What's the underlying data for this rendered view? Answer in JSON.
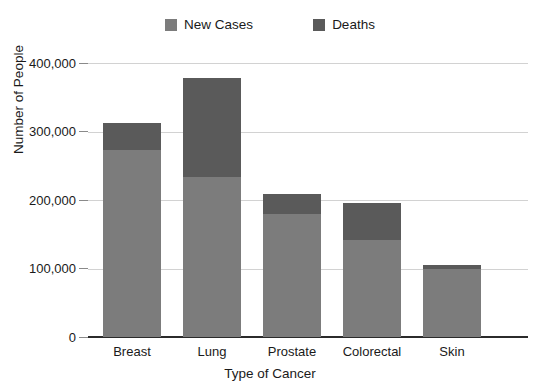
{
  "chart_data": {
    "type": "bar",
    "subtype": "stacked",
    "title": "",
    "xlabel": "Type of Cancer",
    "ylabel": "Number of People",
    "categories": [
      "Breast",
      "Lung",
      "Prostate",
      "Colorectal",
      "Skin"
    ],
    "series": [
      {
        "name": "New Cases",
        "color": "#7c7c7c",
        "values": [
          273000,
          234000,
          180000,
          142000,
          99000
        ]
      },
      {
        "name": "Deaths",
        "color": "#5a5a5a",
        "values": [
          39000,
          144000,
          29000,
          54000,
          6000
        ]
      }
    ],
    "totals": [
      312000,
      378000,
      209000,
      196000,
      105000
    ],
    "ylim": [
      0,
      400000
    ],
    "ytick_values": [
      0,
      100000,
      200000,
      300000,
      400000
    ],
    "ytick_labels": [
      "0",
      "100,000",
      "200,000",
      "300,000",
      "400,000"
    ],
    "grid": true,
    "legend_position": "top-center"
  },
  "legend": {
    "entries": [
      {
        "label": "New Cases",
        "color": "#7c7c7c"
      },
      {
        "label": "Deaths",
        "color": "#5a5a5a"
      }
    ]
  },
  "axes": {
    "y": {
      "title": "Number of People",
      "ticks": [
        "0",
        "100,000",
        "200,000",
        "300,000",
        "400,000"
      ]
    },
    "x": {
      "title": "Type of Cancer",
      "ticks": [
        "Breast",
        "Lung",
        "Prostate",
        "Colorectal",
        "Skin"
      ]
    }
  },
  "colors": {
    "new_cases": "#7c7c7c",
    "deaths": "#5a5a5a",
    "gridline": "#d2d2d2",
    "axis": "#2b2b2b",
    "text": "#1a1a1a",
    "background": "#ffffff"
  }
}
